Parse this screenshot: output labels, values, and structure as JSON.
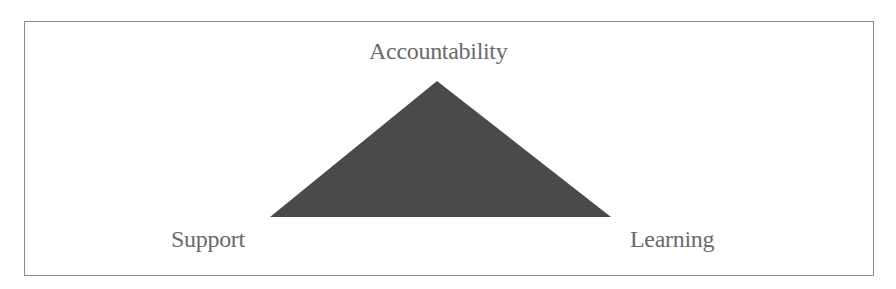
{
  "diagram": {
    "type": "triangle",
    "vertices": {
      "top": "Accountability",
      "bottom_left": "Support",
      "bottom_right": "Learning"
    },
    "triangle_fill": "#4a4a4a",
    "label_color": "#6a6a6a",
    "border_color": "#8a8a8a"
  }
}
